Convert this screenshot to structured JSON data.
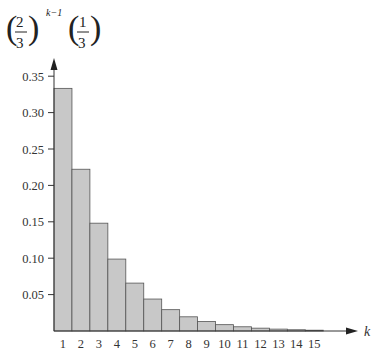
{
  "chart_data": {
    "type": "bar",
    "ylabel_formula": {
      "base_num": "2",
      "base_den": "3",
      "exponent": "k−1",
      "factor_num": "1",
      "factor_den": "3"
    },
    "xlabel": "k",
    "categories": [
      "1",
      "2",
      "3",
      "4",
      "5",
      "6",
      "7",
      "8",
      "9",
      "10",
      "11",
      "12",
      "13",
      "14",
      "15"
    ],
    "values": [
      0.3333,
      0.2222,
      0.1481,
      0.0988,
      0.0658,
      0.0439,
      0.0293,
      0.0195,
      0.013,
      0.0087,
      0.0058,
      0.0039,
      0.0026,
      0.0017,
      0.0011
    ],
    "y_ticks": [
      "0.05",
      "0.10",
      "0.15",
      "0.20",
      "0.25",
      "0.30",
      "0.35"
    ],
    "ylim": [
      0,
      0.37
    ],
    "grid": false,
    "legend": null,
    "bar_color": "#c8c8c8",
    "bar_edge": "#555555"
  }
}
